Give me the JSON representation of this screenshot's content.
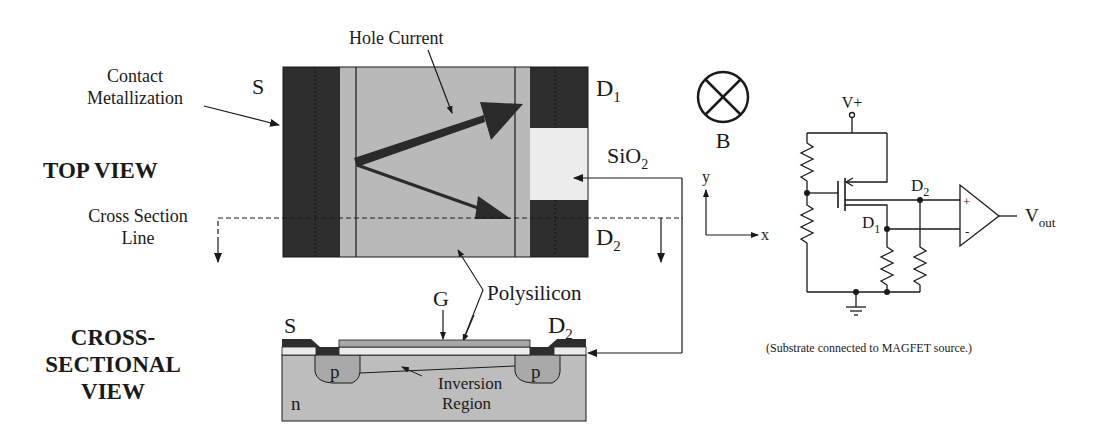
{
  "top_view": {
    "heading": "TOP VIEW",
    "labels": {
      "contact_metallization_line1": "Contact",
      "contact_metallization_line2": "Metallization",
      "source": "S",
      "drain1": "D",
      "drain1_sub": "1",
      "drain2": "D",
      "drain2_sub": "2",
      "hole_current": "Hole Current",
      "sio2": "SiO",
      "sio2_sub": "2",
      "cross_section_line1": "Cross Section",
      "cross_section_line2": "Line",
      "polysilicon": "Polysilicon"
    }
  },
  "cross_section_view": {
    "heading_line1": "CROSS-",
    "heading_line2": "SECTIONAL",
    "heading_line3": "VIEW",
    "labels": {
      "source": "S",
      "gate": "G",
      "drain": "D",
      "drain_sub": "2",
      "p_left": "p",
      "p_right": "p",
      "n": "n",
      "inversion_line1": "Inversion",
      "inversion_line2": "Region"
    }
  },
  "field": {
    "b_label": "B",
    "axis_y": "y",
    "axis_x": "x"
  },
  "circuit": {
    "supply": "V+",
    "d2": "D",
    "d2_sub": "2",
    "d1": "D",
    "d1_sub": "1",
    "plus": "+",
    "minus": "-",
    "vout": "V",
    "vout_sub": "out",
    "caption": "(Substrate connected to MAGFET source.)"
  },
  "colors": {
    "metal": "#2e2e2e",
    "silicon": "#b9b9b9",
    "oxide": "#ececec",
    "poly": "#a8a8a8",
    "line": "#1a1a1a"
  }
}
